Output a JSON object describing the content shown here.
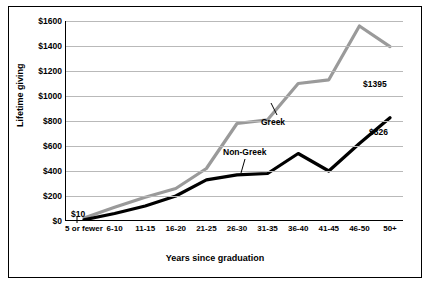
{
  "chart_data": {
    "type": "line",
    "title": "",
    "xlabel": "Years since graduation",
    "ylabel": "Lifetime giving",
    "categories": [
      "5 or fewer",
      "6-10",
      "11-15",
      "16-20",
      "21-25",
      "26-30",
      "31-35",
      "36-40",
      "41-45",
      "46-50",
      "50+"
    ],
    "ylim": [
      0,
      1600
    ],
    "yticks": [
      "$0",
      "$200",
      "$400",
      "$600",
      "$800",
      "$1000",
      "$1200",
      "$1400",
      "$1600"
    ],
    "ytick_values": [
      0,
      200,
      400,
      600,
      800,
      1000,
      1200,
      1400,
      1600
    ],
    "grid": true,
    "legend_position": "inline-annotations",
    "series": [
      {
        "name": "Greek",
        "color": "#9a9a9a",
        "values": [
          25,
          110,
          190,
          260,
          420,
          780,
          810,
          1100,
          1130,
          1560,
          1395
        ]
      },
      {
        "name": "Non-Greek",
        "color": "#000000",
        "values": [
          10,
          60,
          120,
          200,
          330,
          370,
          380,
          540,
          400,
          620,
          826
        ]
      }
    ],
    "annotations": [
      {
        "name": "greek-end-label",
        "text": "$1395"
      },
      {
        "name": "nongreek-end-label",
        "text": "$826"
      },
      {
        "name": "start-value-label",
        "text": "$10"
      },
      {
        "name": "greek-series-label",
        "text": "Greek"
      },
      {
        "name": "nongreek-series-label",
        "text": "Non-Greek"
      }
    ]
  }
}
